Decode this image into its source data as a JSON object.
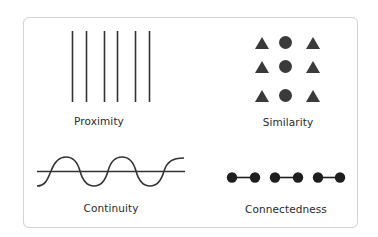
{
  "diagram": {
    "title": "",
    "panels": [
      {
        "id": "proximity",
        "label": "Proximity",
        "shape": "vertical-line-pairs",
        "count": 6
      },
      {
        "id": "similarity",
        "label": "Similarity",
        "shape": "triangle-circle-triangle-grid",
        "rows": 3
      },
      {
        "id": "continuity",
        "label": "Continuity",
        "shape": "sine-wave-over-line"
      },
      {
        "id": "connectedness",
        "label": "Connectedness",
        "shape": "connected-dot-pairs",
        "count": 3
      }
    ],
    "colors": {
      "stroke": "#333333",
      "fill": "#3a3a3a",
      "dots": "#1e1e1e",
      "border": "#d4d4d4"
    }
  }
}
